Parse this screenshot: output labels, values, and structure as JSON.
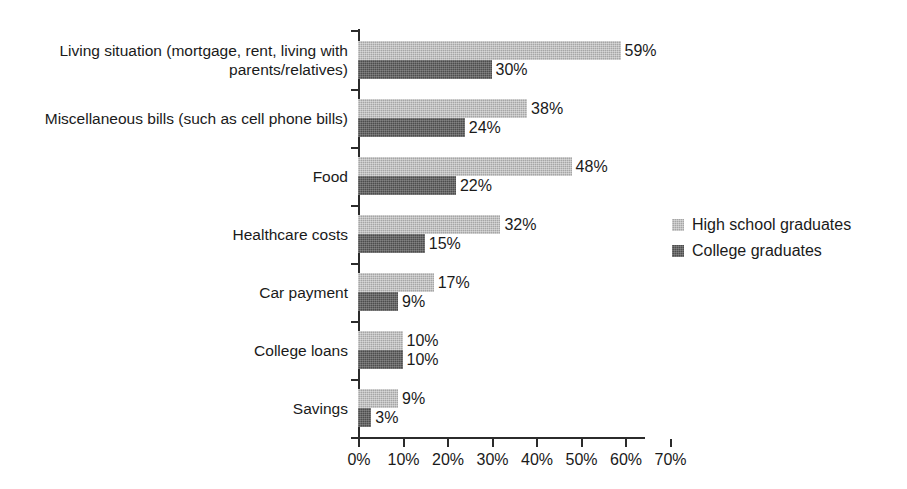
{
  "chart_data": {
    "type": "bar",
    "orientation": "horizontal",
    "title": "",
    "subtitle": "",
    "xlabel": "",
    "ylabel": "",
    "xlim": [
      0,
      70
    ],
    "xtick_labels": [
      "0%",
      "10%",
      "20%",
      "30%",
      "40%",
      "50%",
      "60%",
      "70%"
    ],
    "xtick_values": [
      0,
      10,
      20,
      30,
      40,
      50,
      60,
      70
    ],
    "grid": false,
    "legend_position": "right",
    "value_suffix": "%",
    "categories": [
      "Living situation (mortgage, rent, living with parents/relatives)",
      "Miscellaneous bills (such as cell phone bills)",
      "Food",
      "Healthcare costs",
      "Car payment",
      "College loans",
      "Savings"
    ],
    "series": [
      {
        "name": "High school graduates",
        "color": "#a6a6a6",
        "values": [
          59,
          38,
          48,
          32,
          17,
          10,
          9
        ],
        "labels": [
          "59%",
          "38%",
          "48%",
          "32%",
          "17%",
          "10%",
          "9%"
        ]
      },
      {
        "name": "College graduates",
        "color": "#4d4d4d",
        "values": [
          30,
          24,
          22,
          15,
          9,
          10,
          3
        ],
        "labels": [
          "30%",
          "24%",
          "22%",
          "15%",
          "9%",
          "10%",
          "3%"
        ]
      }
    ]
  },
  "colors": {
    "background": "#ffffff",
    "axis": "#2b2b2b",
    "text": "#1a1a1a",
    "series_high_school": "#a6a6a6",
    "series_college": "#4d4d4d"
  }
}
